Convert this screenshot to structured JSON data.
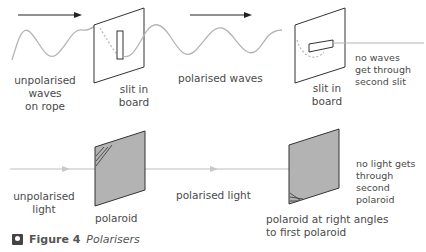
{
  "top_row": {
    "labels": {
      "unpolarised_waves": "unpolarised\nwaves\non rope",
      "slit_in_board_1": "slit in\nboard",
      "polarised_waves": "polarised waves",
      "slit_in_board_2": "slit in\nboard",
      "no_waves": "no waves\nget through\nsecond slit"
    }
  },
  "bottom_row": {
    "labels": {
      "unpolarised_light": "unpolarised\nlight",
      "polaroid": "polaroid",
      "polarised_light": "polarised light",
      "polaroid_right_angles": "polaroid at right angles\nto first polaroid",
      "no_light": "no light gets\nthrough second\npolaroid"
    }
  },
  "caption": {
    "figure": "Figure 4",
    "title": "Polarisers",
    "icon": "lightbulb-icon"
  },
  "colors": {
    "line": "#222222",
    "wave": "#b5b5b5",
    "polaroid_fill": "#b3b3b3",
    "light_ray": "#c0c0c0"
  }
}
